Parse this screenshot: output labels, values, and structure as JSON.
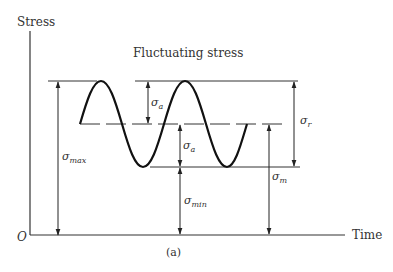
{
  "figure": {
    "title": "Fluctuating stress",
    "caption": "(a)",
    "axes": {
      "y_label": "Stress",
      "x_label": "Time",
      "origin_label": "O"
    },
    "labels": {
      "sigma_a_upper": {
        "base": "σ",
        "sub": "a"
      },
      "sigma_a_lower": {
        "base": "σ",
        "sub": "a"
      },
      "sigma_max": {
        "base": "σ",
        "sub": "max"
      },
      "sigma_min": {
        "base": "σ",
        "sub": "min"
      },
      "sigma_m": {
        "base": "σ",
        "sub": "m"
      },
      "sigma_r": {
        "base": "σ",
        "sub": "r"
      }
    },
    "colors": {
      "ink": "#222222",
      "text": "#333333",
      "background": "#ffffff"
    }
  }
}
